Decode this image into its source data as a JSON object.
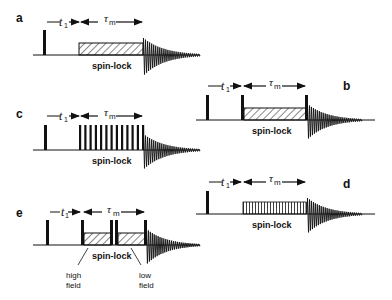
{
  "figure": {
    "panels": [
      {
        "id": "a",
        "label": "a",
        "spinlock_label": "spin-lock",
        "t1_label": "t",
        "t1_sub": "1",
        "tau_label": "τ",
        "tau_sub": "m",
        "type": "hatched continuous spin-lock"
      },
      {
        "id": "b",
        "label": "b",
        "spinlock_label": "spin-lock",
        "t1_label": "t",
        "t1_sub": "1",
        "tau_label": "τ",
        "tau_sub": "m",
        "type": "hatched spin-lock bracketed by pulses"
      },
      {
        "id": "c",
        "label": "c",
        "spinlock_label": "spin-lock",
        "t1_label": "t",
        "t1_sub": "1",
        "tau_label": "τ",
        "tau_sub": "m",
        "type": "pulse train spin-lock"
      },
      {
        "id": "d",
        "label": "d",
        "spinlock_label": "spin-lock",
        "t1_label": "t",
        "t1_sub": "1",
        "tau_label": "τ",
        "tau_sub": "m",
        "type": "dense thin-pulse spin-lock"
      },
      {
        "id": "e",
        "label": "e",
        "spinlock_label": "spin-lock",
        "t1_label": "t",
        "t1_sub": "1",
        "tau_label": "τ",
        "tau_sub": "m",
        "type": "two-segment spin-lock",
        "high_field_label_1": "high",
        "high_field_label_2": "field",
        "low_field_label_1": "low",
        "low_field_label_2": "field"
      }
    ],
    "colors": {
      "ink": "#111111",
      "background": "#ffffff"
    }
  }
}
